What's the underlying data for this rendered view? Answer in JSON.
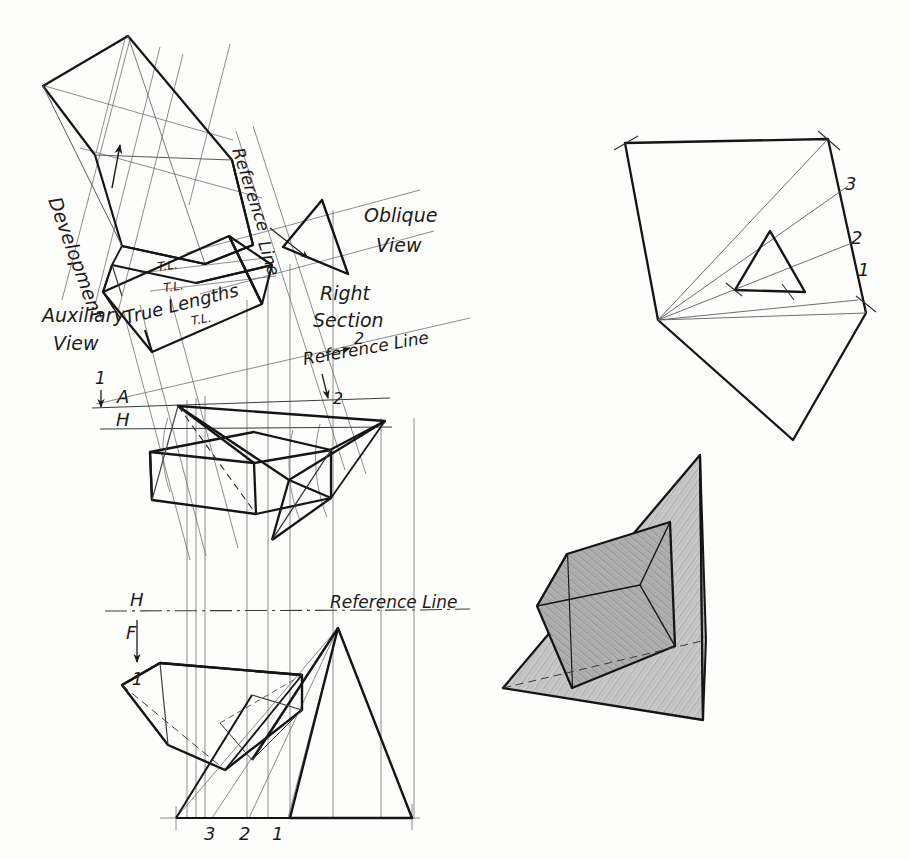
{
  "drawing": {
    "title": "Development of an Oblique Prism by Right Section",
    "paper_color": "#fdfdfc",
    "ink_color": "#1b1b1b",
    "construction_line_color": "#6e6e6e",
    "shade_color": "#b3b3b3",
    "width": 909,
    "height": 859
  },
  "labels": {
    "development": "Development",
    "auxiliary_view": "Auxiliary",
    "auxiliary_view2": "View",
    "reference_line_rot": "Reference",
    "reference_line_rot2": "Line",
    "oblique_view": "Oblique",
    "oblique_view2": "View",
    "right_section": "Right",
    "right_section2": "Section",
    "reference_line_slant": "Reference Line",
    "reference_line_horiz": "Reference Line",
    "true_lengths": "True Lengths",
    "tl_1": "T.L.",
    "tl_2": "T.L.",
    "tl_3": "T.L.",
    "plane_a": "A",
    "plane_h_top": "H",
    "plane_h_front": "H",
    "plane_f": "F"
  },
  "markers": {
    "one_top": "1",
    "one_front": "1",
    "two_slant": "2",
    "two_down": "2",
    "edge_3": "3",
    "edge_2": "2",
    "edge_1": "1",
    "dev_3": "3",
    "dev_2": "2",
    "dev_1": "1"
  },
  "figures": {
    "development_pattern": "development-pattern-upper-left",
    "true_length_box": "true-length-construction",
    "oblique_view_triangle": "oblique-view-triangle",
    "top_view": "top-view-oblique-prism",
    "front_view": "front-view-oblique-prism",
    "development_right": "development-fan-upper-right",
    "pictorial": "shaded-pictorial-prism"
  }
}
